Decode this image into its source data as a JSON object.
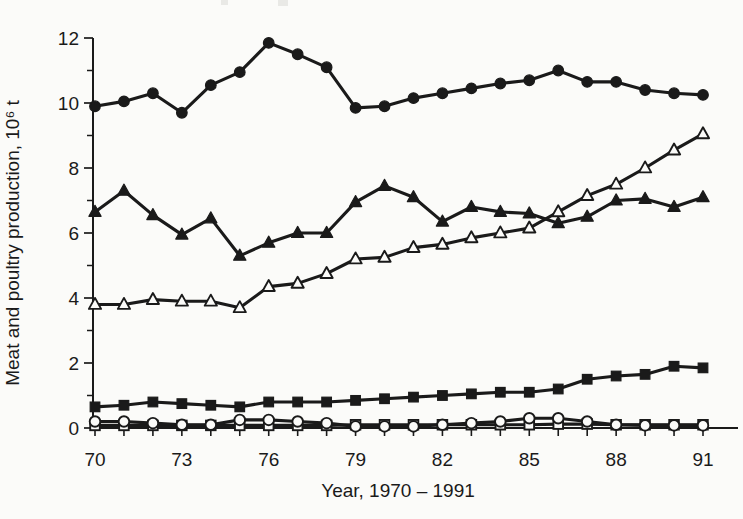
{
  "figure": {
    "background": "#fbfbf9",
    "ink": "#1a1a1a"
  },
  "chart_data": {
    "type": "line",
    "title": "",
    "xlabel": "Year, 1970 – 1991",
    "ylabel": "Meat and poultry production, 10⁶ t",
    "years": [
      70,
      71,
      72,
      73,
      74,
      75,
      76,
      77,
      78,
      79,
      80,
      81,
      82,
      83,
      84,
      85,
      86,
      87,
      88,
      89,
      90,
      91
    ],
    "x_tick_labels": [
      "70",
      "73",
      "76",
      "79",
      "82",
      "85",
      "88",
      "91"
    ],
    "y_tick_labels": [
      "0",
      "2",
      "4",
      "6",
      "8",
      "10",
      "12"
    ],
    "y_major_ticks": [
      0,
      2,
      4,
      6,
      8,
      10,
      12
    ],
    "y_minor_ticks": [
      1,
      3,
      5,
      7,
      9,
      11
    ],
    "xlim": [
      70,
      91
    ],
    "ylim": [
      0,
      12
    ],
    "grid": false,
    "legend": "none",
    "series": [
      {
        "name": "filled-circle",
        "marker": "circle",
        "fill": "filled",
        "values": [
          9.9,
          10.05,
          10.3,
          9.7,
          10.55,
          10.95,
          11.85,
          11.5,
          11.1,
          9.85,
          9.9,
          10.15,
          10.3,
          10.45,
          10.6,
          10.7,
          11.0,
          10.65,
          10.65,
          10.4,
          10.3,
          10.25
        ]
      },
      {
        "name": "filled-triangle",
        "marker": "triangle",
        "fill": "filled",
        "values": [
          6.65,
          7.3,
          6.55,
          5.95,
          6.45,
          5.3,
          5.7,
          6.0,
          6.0,
          6.95,
          7.45,
          7.1,
          6.35,
          6.8,
          6.65,
          6.6,
          6.3,
          6.5,
          7.0,
          7.05,
          6.8,
          7.1
        ]
      },
      {
        "name": "open-triangle",
        "marker": "triangle",
        "fill": "open",
        "values": [
          3.8,
          3.8,
          3.95,
          3.9,
          3.9,
          3.7,
          4.35,
          4.45,
          4.75,
          5.2,
          5.25,
          5.55,
          5.65,
          5.85,
          6.0,
          6.15,
          6.65,
          7.15,
          7.5,
          8.0,
          8.55,
          9.05
        ]
      },
      {
        "name": "filled-square",
        "marker": "square",
        "fill": "filled",
        "values": [
          0.65,
          0.7,
          0.8,
          0.75,
          0.7,
          0.65,
          0.8,
          0.8,
          0.8,
          0.85,
          0.9,
          0.95,
          1.0,
          1.05,
          1.1,
          1.1,
          1.2,
          1.5,
          1.6,
          1.65,
          1.9,
          1.85
        ]
      },
      {
        "name": "open-circle",
        "marker": "circle",
        "fill": "open",
        "values": [
          0.2,
          0.2,
          0.15,
          0.1,
          0.1,
          0.25,
          0.25,
          0.2,
          0.15,
          0.05,
          0.05,
          0.05,
          0.1,
          0.15,
          0.2,
          0.3,
          0.3,
          0.2,
          0.1,
          0.08,
          0.08,
          0.08
        ]
      },
      {
        "name": "open-square",
        "marker": "square",
        "fill": "open",
        "values": [
          0.08,
          0.08,
          0.08,
          0.08,
          0.08,
          0.08,
          0.08,
          0.08,
          0.08,
          0.1,
          0.1,
          0.1,
          0.1,
          0.1,
          0.1,
          0.1,
          0.12,
          0.12,
          0.1,
          0.1,
          0.1,
          0.1
        ]
      }
    ]
  }
}
